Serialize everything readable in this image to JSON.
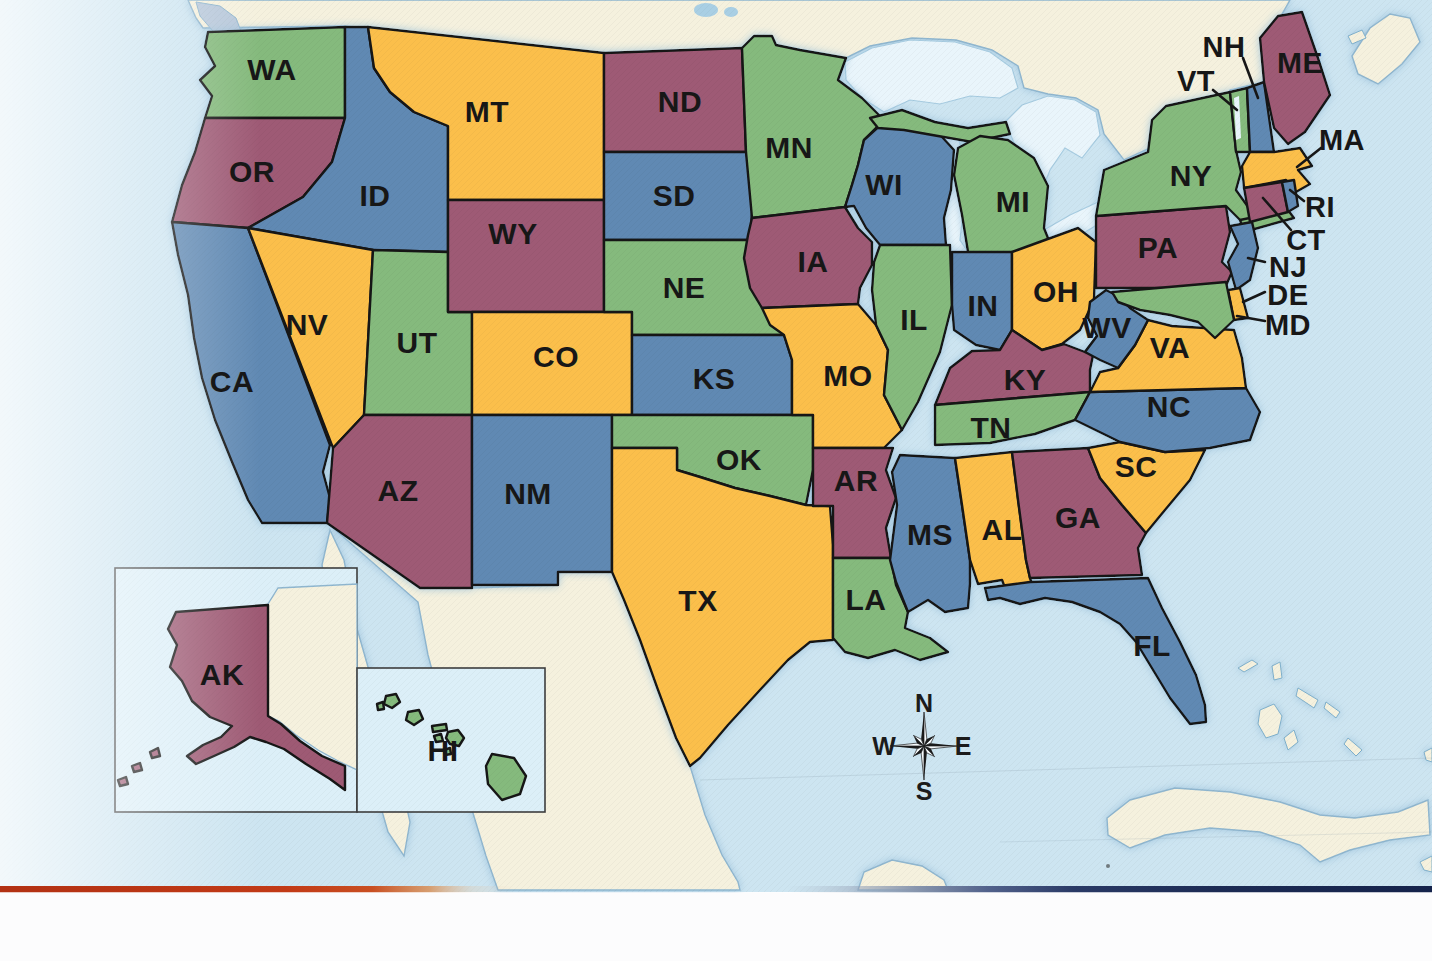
{
  "map": {
    "colors": {
      "green": "#85BA7D",
      "yellow": "#FBBF4B",
      "maroon": "#9E5A74",
      "blue": "#6189B3",
      "water": "#CDE5F1",
      "water_inset": "#DCEFF8",
      "foreign_land": "#F5F1DE",
      "lake": "#E9F5FB",
      "island_gray": "#B9C9DB",
      "border": "#161616",
      "label": "#171717",
      "bar_red": "#C23A16",
      "bar_navy": "#1B2A52"
    },
    "states": [
      {
        "abbr": "WA",
        "color": "green"
      },
      {
        "abbr": "OR",
        "color": "maroon"
      },
      {
        "abbr": "CA",
        "color": "blue"
      },
      {
        "abbr": "ID",
        "color": "blue"
      },
      {
        "abbr": "NV",
        "color": "yellow"
      },
      {
        "abbr": "UT",
        "color": "green"
      },
      {
        "abbr": "AZ",
        "color": "maroon"
      },
      {
        "abbr": "MT",
        "color": "yellow"
      },
      {
        "abbr": "WY",
        "color": "maroon"
      },
      {
        "abbr": "CO",
        "color": "yellow"
      },
      {
        "abbr": "NM",
        "color": "blue"
      },
      {
        "abbr": "ND",
        "color": "maroon"
      },
      {
        "abbr": "SD",
        "color": "blue"
      },
      {
        "abbr": "NE",
        "color": "green"
      },
      {
        "abbr": "KS",
        "color": "blue"
      },
      {
        "abbr": "OK",
        "color": "green"
      },
      {
        "abbr": "TX",
        "color": "yellow"
      },
      {
        "abbr": "MN",
        "color": "green"
      },
      {
        "abbr": "IA",
        "color": "maroon"
      },
      {
        "abbr": "MO",
        "color": "yellow"
      },
      {
        "abbr": "AR",
        "color": "maroon"
      },
      {
        "abbr": "LA",
        "color": "green"
      },
      {
        "abbr": "WI",
        "color": "blue"
      },
      {
        "abbr": "IL",
        "color": "green"
      },
      {
        "abbr": "MI",
        "color": "green"
      },
      {
        "abbr": "IN",
        "color": "blue"
      },
      {
        "abbr": "OH",
        "color": "yellow"
      },
      {
        "abbr": "KY",
        "color": "maroon"
      },
      {
        "abbr": "TN",
        "color": "green"
      },
      {
        "abbr": "MS",
        "color": "blue"
      },
      {
        "abbr": "AL",
        "color": "yellow"
      },
      {
        "abbr": "GA",
        "color": "maroon"
      },
      {
        "abbr": "FL",
        "color": "blue"
      },
      {
        "abbr": "SC",
        "color": "yellow"
      },
      {
        "abbr": "NC",
        "color": "blue"
      },
      {
        "abbr": "VA",
        "color": "yellow"
      },
      {
        "abbr": "WV",
        "color": "blue"
      },
      {
        "abbr": "PA",
        "color": "maroon"
      },
      {
        "abbr": "NY",
        "color": "green"
      },
      {
        "abbr": "NJ",
        "color": "blue"
      },
      {
        "abbr": "DE",
        "color": "yellow"
      },
      {
        "abbr": "MD",
        "color": "green"
      },
      {
        "abbr": "VT",
        "color": "green"
      },
      {
        "abbr": "NH",
        "color": "blue"
      },
      {
        "abbr": "ME",
        "color": "maroon"
      },
      {
        "abbr": "MA",
        "color": "yellow"
      },
      {
        "abbr": "CT",
        "color": "maroon"
      },
      {
        "abbr": "RI",
        "color": "blue"
      },
      {
        "abbr": "AK",
        "color": "maroon"
      },
      {
        "abbr": "HI",
        "color": "green"
      }
    ],
    "compass": {
      "n": "N",
      "e": "E",
      "s": "S",
      "w": "W"
    }
  }
}
